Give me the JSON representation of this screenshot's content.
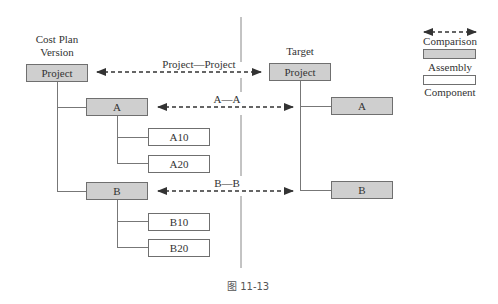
{
  "left_tree": {
    "heading_line1": "Cost Plan",
    "heading_line2": "Version",
    "root": "Project",
    "assemblies": [
      {
        "label": "A",
        "components": [
          "A10",
          "A20"
        ]
      },
      {
        "label": "B",
        "components": [
          "B10",
          "B20"
        ]
      }
    ]
  },
  "right_tree": {
    "heading": "Target",
    "root": "Project",
    "assemblies": [
      {
        "label": "A"
      },
      {
        "label": "B"
      }
    ]
  },
  "comparisons": [
    {
      "label": "Project—Project"
    },
    {
      "label": "A—A"
    },
    {
      "label": "B—B"
    }
  ],
  "legend": {
    "comparison": "Comparison",
    "assembly": "Assembly",
    "component": "Component"
  },
  "colors": {
    "assembly_fill": "#cfcfcf",
    "component_fill": "#ffffff",
    "line": "#777777",
    "arrow": "#333333"
  },
  "caption": "图 11-13"
}
